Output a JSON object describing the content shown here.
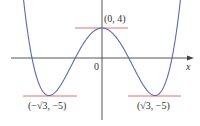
{
  "chart_data": {
    "type": "line",
    "title": "",
    "function": "y = x^4 - 6x^2 + 4",
    "xlabel": "x",
    "ylabel": "y",
    "origin_label": "0",
    "xlim": [
      -3.3,
      2.97
    ],
    "ylim": [
      -8.9,
      7.7
    ],
    "grid": false,
    "series": [
      {
        "name": "f(x)",
        "color": "#5a6ab0",
        "x": [
          -2.65,
          -2.5,
          -2.288,
          -2.0,
          -1.732,
          -1.5,
          -1.0,
          -0.874,
          -0.5,
          0,
          0.5,
          0.874,
          1.0,
          1.5,
          1.732,
          2.0,
          2.288,
          2.5,
          2.65
        ],
        "y": [
          11.7,
          1.56,
          0,
          -4.0,
          -5.0,
          -4.44,
          -1.0,
          0,
          2.56,
          4,
          2.56,
          0,
          -1.0,
          -4.44,
          -5.0,
          -4.0,
          0,
          1.56,
          11.7
        ]
      }
    ],
    "annotations": [
      {
        "label": "(0, 4)",
        "x": 0,
        "y": 4,
        "type": "local maximum",
        "tangent_color": "#e07070"
      },
      {
        "label": "(−√3, −5)",
        "x": -1.732,
        "y": -5,
        "type": "local minimum",
        "tangent_color": "#e07070"
      },
      {
        "label": "(√3, −5)",
        "x": 1.732,
        "y": -5,
        "type": "local minimum",
        "tangent_color": "#e07070"
      }
    ]
  },
  "labels": {
    "max": "(0, 4)",
    "min_left": "(−√3, −5)",
    "min_right": "(√3, −5)",
    "origin": "0",
    "x_axis": "x"
  },
  "colors": {
    "curve": "#5a6ab0",
    "tangent": "#e07070",
    "axis": "#444444"
  }
}
